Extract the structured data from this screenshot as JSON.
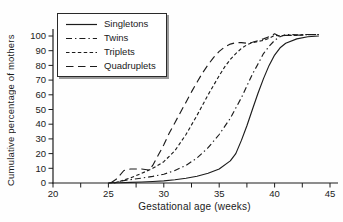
{
  "figure": {
    "background": "#fefefe",
    "line_color": "#1c1c1c",
    "text_color": "#1a1a1a",
    "legend_border_color": "#2a2a2a",
    "legend_shadow_color": "#9a9a9a"
  },
  "chart_data": {
    "type": "line",
    "title": "",
    "xlabel": "Gestational age (weeks)",
    "ylabel": "Cumulative percentage of mothers",
    "xlim": [
      20,
      45
    ],
    "ylim": [
      0,
      100
    ],
    "x_ticks": [
      20,
      25,
      30,
      35,
      40,
      45
    ],
    "x_minor_tick_step": 2.5,
    "y_ticks": [
      0,
      10,
      20,
      30,
      40,
      50,
      60,
      70,
      80,
      90,
      100
    ],
    "grid": false,
    "legend_position": "top-left",
    "note": "Values are as-drawn estimates read from the scanned plot; curves wobble 1-2% around 100 at the right end.",
    "series": [
      {
        "name": "Singletons",
        "dash": "solid",
        "points": [
          [
            25,
            0
          ],
          [
            26,
            0.2
          ],
          [
            27,
            0.4
          ],
          [
            28,
            0.7
          ],
          [
            29,
            1
          ],
          [
            30,
            1.4
          ],
          [
            31,
            2.2
          ],
          [
            32,
            3.2
          ],
          [
            33,
            4.6
          ],
          [
            34,
            6.6
          ],
          [
            35,
            9.5
          ],
          [
            36,
            15
          ],
          [
            36.5,
            20
          ],
          [
            37,
            29
          ],
          [
            37.5,
            39
          ],
          [
            38,
            50
          ],
          [
            38.5,
            61
          ],
          [
            39,
            71
          ],
          [
            39.5,
            80
          ],
          [
            40,
            87
          ],
          [
            40.5,
            92
          ],
          [
            41,
            95
          ],
          [
            42,
            98
          ],
          [
            43,
            99.5
          ],
          [
            44,
            100
          ]
        ]
      },
      {
        "name": "Twins",
        "dash": "dash-dot",
        "points": [
          [
            25,
            0
          ],
          [
            25.8,
            0.8
          ],
          [
            26.5,
            1.8
          ],
          [
            27,
            2.3
          ],
          [
            28,
            3.3
          ],
          [
            29,
            4.5
          ],
          [
            30,
            6
          ],
          [
            31,
            8.5
          ],
          [
            32,
            12
          ],
          [
            33,
            17
          ],
          [
            34,
            24
          ],
          [
            35,
            33
          ],
          [
            36,
            44
          ],
          [
            36.5,
            51
          ],
          [
            37,
            58
          ],
          [
            37.5,
            66
          ],
          [
            38,
            74
          ],
          [
            38.5,
            81
          ],
          [
            39,
            88
          ],
          [
            39.5,
            93
          ],
          [
            40,
            97
          ],
          [
            40.5,
            99.5
          ],
          [
            41,
            101
          ],
          [
            42,
            100.8
          ],
          [
            43,
            101
          ],
          [
            44,
            101
          ]
        ]
      },
      {
        "name": "Triplets",
        "dash": "short-dash",
        "points": [
          [
            25.5,
            0
          ],
          [
            26,
            1
          ],
          [
            27,
            3.5
          ],
          [
            28,
            6.5
          ],
          [
            29,
            10
          ],
          [
            30,
            14.5
          ],
          [
            31,
            22
          ],
          [
            32,
            33
          ],
          [
            33,
            46
          ],
          [
            34,
            60
          ],
          [
            35,
            73
          ],
          [
            35.5,
            79
          ],
          [
            36,
            84
          ],
          [
            36.5,
            88
          ],
          [
            37,
            91.5
          ],
          [
            37.5,
            94
          ],
          [
            38,
            95.5
          ],
          [
            39,
            97
          ],
          [
            39.5,
            98.5
          ],
          [
            40,
            100.5
          ],
          [
            40.5,
            100
          ],
          [
            41,
            100.5
          ],
          [
            42,
            100.5
          ],
          [
            43,
            101
          ],
          [
            44,
            101
          ]
        ]
      },
      {
        "name": "Quadruplets",
        "dash": "long-dash",
        "points": [
          [
            25.2,
            0
          ],
          [
            25.7,
            2.5
          ],
          [
            26,
            5
          ],
          [
            26.4,
            8.5
          ],
          [
            27,
            9.5
          ],
          [
            28,
            9.5
          ],
          [
            28.7,
            8.8
          ],
          [
            29,
            12
          ],
          [
            29.5,
            19
          ],
          [
            30,
            26
          ],
          [
            30.5,
            34
          ],
          [
            31,
            41
          ],
          [
            31.5,
            48
          ],
          [
            32,
            55
          ],
          [
            32.5,
            62
          ],
          [
            33,
            68.5
          ],
          [
            33.5,
            75
          ],
          [
            34,
            80.5
          ],
          [
            34.5,
            85.5
          ],
          [
            35,
            89.5
          ],
          [
            35.5,
            92.5
          ],
          [
            36,
            94.5
          ],
          [
            36.5,
            95.5
          ],
          [
            37,
            95.5
          ],
          [
            37.5,
            95
          ],
          [
            38,
            95.8
          ],
          [
            38.5,
            96.8
          ],
          [
            39,
            98
          ],
          [
            39.5,
            99.5
          ],
          [
            40,
            101.5
          ],
          [
            40.4,
            100
          ],
          [
            41,
            100.5
          ],
          [
            42,
            100.5
          ],
          [
            43,
            100.8
          ],
          [
            44,
            101
          ]
        ]
      }
    ]
  }
}
